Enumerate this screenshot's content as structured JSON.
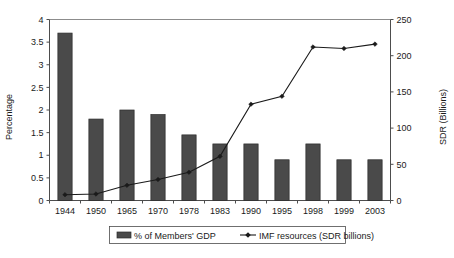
{
  "chart_data": {
    "type": "bar",
    "title": "",
    "subtitle": "",
    "xlabel": "",
    "ylabel": "Percentage",
    "y2label": "SDR (Billions)",
    "categories": [
      "1944",
      "1950",
      "1965",
      "1970",
      "1978",
      "1983",
      "1990",
      "1995",
      "1998",
      "1999",
      "2003"
    ],
    "ylim": [
      0,
      4
    ],
    "y2lim": [
      0,
      250
    ],
    "yticks": [
      "0",
      "0.5",
      "1",
      "1.5",
      "2",
      "2.5",
      "3",
      "3.5",
      "4"
    ],
    "ytick_values": [
      0,
      0.5,
      1,
      1.5,
      2,
      2.5,
      3,
      3.5,
      4
    ],
    "y2ticks": [
      "0",
      "50",
      "100",
      "150",
      "200",
      "250"
    ],
    "y2tick_values": [
      0,
      50,
      100,
      150,
      200,
      250
    ],
    "grid": false,
    "legend_position": "bottom",
    "series": [
      {
        "name": "% of Members' GDP",
        "type": "bar",
        "axis": "left",
        "color": "#4a4a4a",
        "values": [
          3.7,
          1.8,
          2.0,
          1.9,
          1.45,
          1.25,
          1.25,
          0.9,
          1.25,
          0.9,
          0.9
        ]
      },
      {
        "name": "IMF resources (SDR billions)",
        "type": "line",
        "axis": "right",
        "color": "#1a1a1a",
        "marker": "diamond",
        "values": [
          8,
          9,
          21,
          29,
          39,
          61,
          133,
          144,
          212,
          210,
          216
        ]
      }
    ]
  },
  "legend": {
    "items": [
      {
        "label": "% of Members' GDP",
        "marker": "bar-swatch"
      },
      {
        "label": "IMF resources (SDR billions)",
        "marker": "line-marker"
      }
    ]
  },
  "axes": {
    "left_title": "Percentage",
    "right_title": "SDR (Billions)"
  }
}
